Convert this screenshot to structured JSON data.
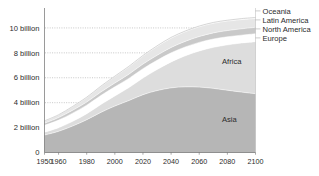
{
  "chart_data": {
    "type": "area",
    "stacked": true,
    "title": "",
    "subtitle": "",
    "xlabel": "",
    "ylabel": "",
    "xlim": [
      1950,
      2100
    ],
    "ylim": [
      0,
      11.6
    ],
    "grid": "horizontal-dotted",
    "legend_position": "right-outside-top",
    "units": "billion people",
    "x": [
      1950,
      1960,
      1970,
      1980,
      1990,
      2000,
      2010,
      2020,
      2030,
      2040,
      2050,
      2060,
      2070,
      2080,
      2090,
      2100
    ],
    "series": [
      {
        "name": "Asia",
        "color": "#b6b6b6",
        "values": [
          1.4,
          1.7,
          2.13,
          2.63,
          3.22,
          3.73,
          4.17,
          4.64,
          4.97,
          5.19,
          5.27,
          5.25,
          5.15,
          5.0,
          4.85,
          4.72
        ]
      },
      {
        "name": "Africa",
        "color": "#dddddd",
        "values": [
          0.23,
          0.29,
          0.37,
          0.48,
          0.63,
          0.81,
          1.04,
          1.34,
          1.69,
          2.08,
          2.49,
          2.9,
          3.29,
          3.64,
          3.94,
          4.18
        ]
      },
      {
        "name": "Europe",
        "color": "#ffffff",
        "values": [
          0.55,
          0.61,
          0.66,
          0.69,
          0.72,
          0.73,
          0.74,
          0.75,
          0.74,
          0.73,
          0.71,
          0.69,
          0.67,
          0.65,
          0.63,
          0.63
        ]
      },
      {
        "name": "North America",
        "color": "#c9c9c9",
        "values": [
          0.17,
          0.2,
          0.23,
          0.25,
          0.28,
          0.31,
          0.34,
          0.37,
          0.4,
          0.43,
          0.45,
          0.47,
          0.49,
          0.5,
          0.51,
          0.52
        ]
      },
      {
        "name": "Latin America",
        "color": "#e6e6e6",
        "values": [
          0.17,
          0.22,
          0.29,
          0.36,
          0.44,
          0.52,
          0.59,
          0.65,
          0.71,
          0.75,
          0.77,
          0.78,
          0.77,
          0.76,
          0.74,
          0.71
        ]
      },
      {
        "name": "Oceania",
        "color": "#f5f5f5",
        "values": [
          0.013,
          0.016,
          0.02,
          0.023,
          0.027,
          0.031,
          0.037,
          0.043,
          0.049,
          0.055,
          0.06,
          0.064,
          0.068,
          0.071,
          0.074,
          0.076
        ]
      }
    ],
    "totals": [
      2.54,
      3.03,
      3.7,
      4.44,
      5.32,
      6.13,
      6.92,
      7.79,
      8.56,
      9.24,
      9.75,
      10.15,
      10.44,
      10.62,
      10.75,
      10.84
    ],
    "y_ticks": [
      0,
      2,
      4,
      6,
      8,
      10
    ],
    "y_tick_labels": [
      "0",
      "2 billion",
      "4 billion",
      "6 billion",
      "8 billion",
      "10 billion"
    ],
    "x_ticks": [
      1950,
      1960,
      1980,
      2000,
      2020,
      2040,
      2060,
      2080,
      2100
    ],
    "x_tick_labels": [
      "1950",
      "1960",
      "1980",
      "2000",
      "2020",
      "2040",
      "2060",
      "2080",
      "2100"
    ],
    "inside_labels": [
      {
        "text": "Africa",
        "series": "Africa"
      },
      {
        "text": "Asia",
        "series": "Asia"
      }
    ],
    "legend": [
      {
        "label": "Oceania",
        "color": "#f5f5f5"
      },
      {
        "label": "Latin America",
        "color": "#e6e6e6"
      },
      {
        "label": "North America",
        "color": "#c9c9c9"
      },
      {
        "label": "Europe",
        "color": "#ffffff"
      }
    ]
  },
  "axis": {
    "y_label_0": "0",
    "y_label_2": "2 billion",
    "y_label_4": "4 billion",
    "y_label_6": "6 billion",
    "y_label_8": "8 billion",
    "y_label_10": "10 billion",
    "x_label_1950": "1950",
    "x_label_1960": "1960",
    "x_label_1980": "1980",
    "x_label_2000": "2000",
    "x_label_2020": "2020",
    "x_label_2040": "2040",
    "x_label_2060": "2060",
    "x_label_2080": "2080",
    "x_label_2100": "2100"
  },
  "labels": {
    "africa": "Africa",
    "asia": "Asia",
    "oceania": "Oceania",
    "latin_america": "Latin America",
    "north_america": "North America",
    "europe": "Europe"
  }
}
